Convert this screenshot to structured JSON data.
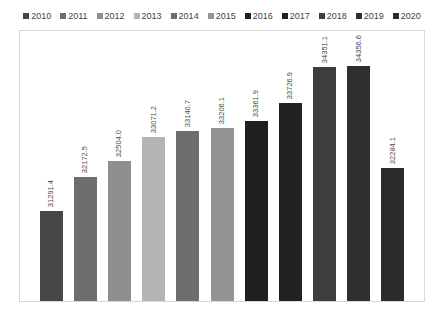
{
  "chart_data": {
    "type": "bar",
    "title": "",
    "subtitle": "",
    "xlabel": "",
    "ylabel": "",
    "grid": false,
    "legend_position": "top",
    "ylim": [
      0,
      38000
    ],
    "categories": [
      "2010",
      "2011",
      "2012",
      "2013",
      "2014",
      "2015",
      "2016",
      "2017",
      "2018",
      "2019",
      "2020"
    ],
    "values": [
      31291.4,
      32172.5,
      32504.0,
      33071.2,
      33140.7,
      33206.1,
      33361.9,
      33726.9,
      34351.1,
      34356.6,
      32284.1
    ],
    "value_labels": [
      "31291.4",
      "32172.5",
      "32504.0",
      "33071.2",
      "33140.7",
      "33206.1",
      "33361.9",
      "33726.9",
      "34351.1",
      "34356.6",
      "32284.1"
    ],
    "colors": [
      "#474747",
      "#6e6e6e",
      "#8f8f8f",
      "#b4b4b4",
      "#6e6e6e",
      "#949494",
      "#1f1f1f",
      "#222222",
      "#3d3d3d",
      "#2f2f2f",
      "#2b2b2b"
    ],
    "bar_pixel_heights": [
      90,
      124,
      140,
      164,
      170,
      173,
      180,
      198,
      234,
      235,
      133
    ],
    "legend": [
      {
        "label": "2010",
        "color": "#474747"
      },
      {
        "label": "2011",
        "color": "#6e6e6e"
      },
      {
        "label": "2012",
        "color": "#8f8f8f"
      },
      {
        "label": "2013",
        "color": "#b4b4b4"
      },
      {
        "label": "2014",
        "color": "#6e6e6e"
      },
      {
        "label": "2015",
        "color": "#949494"
      },
      {
        "label": "2016",
        "color": "#1f1f1f"
      },
      {
        "label": "2017",
        "color": "#222222"
      },
      {
        "label": "2018",
        "color": "#3d3d3d"
      },
      {
        "label": "2019",
        "color": "#2f2f2f"
      },
      {
        "label": "2020",
        "color": "#2b2b2b"
      }
    ]
  },
  "style": {
    "plot_border_color": "#d8d8d8",
    "background": "#ffffff",
    "label_color": "#4a4a4a",
    "legend_text_color": "#3f3f3f"
  }
}
